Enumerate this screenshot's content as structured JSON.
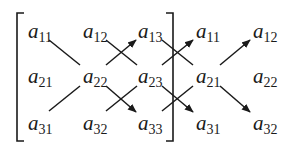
{
  "diagram": {
    "matrix": [
      [
        "a11",
        "a12",
        "a13"
      ],
      [
        "a21",
        "a22",
        "a23"
      ],
      [
        "a31",
        "a32",
        "a33"
      ]
    ],
    "appended_columns": [
      [
        "a11",
        "a12"
      ],
      [
        "a21",
        "a22"
      ],
      [
        "a31",
        "a32"
      ]
    ],
    "cells": [
      {
        "base": "a",
        "sub": "11",
        "x": 28,
        "y": 38
      },
      {
        "base": "a",
        "sub": "12",
        "x": 83,
        "y": 38
      },
      {
        "base": "a",
        "sub": "13",
        "x": 138,
        "y": 38
      },
      {
        "base": "a",
        "sub": "21",
        "x": 28,
        "y": 83
      },
      {
        "base": "a",
        "sub": "22",
        "x": 83,
        "y": 83
      },
      {
        "base": "a",
        "sub": "23",
        "x": 138,
        "y": 83
      },
      {
        "base": "a",
        "sub": "31",
        "x": 28,
        "y": 130
      },
      {
        "base": "a",
        "sub": "32",
        "x": 83,
        "y": 130
      },
      {
        "base": "a",
        "sub": "33",
        "x": 138,
        "y": 130
      },
      {
        "base": "a",
        "sub": "11",
        "x": 196,
        "y": 38
      },
      {
        "base": "a",
        "sub": "12",
        "x": 253,
        "y": 38
      },
      {
        "base": "a",
        "sub": "21",
        "x": 196,
        "y": 83
      },
      {
        "base": "a",
        "sub": "22",
        "x": 253,
        "y": 83
      },
      {
        "base": "a",
        "sub": "31",
        "x": 196,
        "y": 130
      },
      {
        "base": "a",
        "sub": "32",
        "x": 253,
        "y": 130
      }
    ]
  }
}
